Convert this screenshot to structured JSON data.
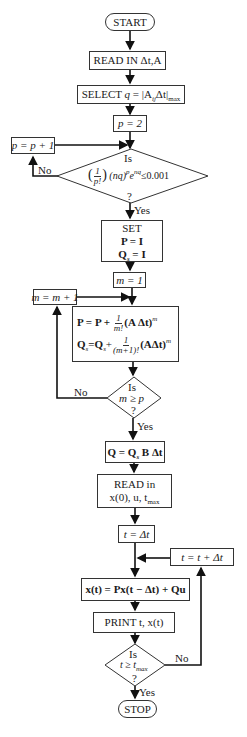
{
  "flowchart": {
    "start": "START",
    "read_in_1": "READ IN Δt,A",
    "select": {
      "prefix": "SELECT ",
      "q": "q",
      "eq": " = |A",
      "sub_ij": "ij",
      "dt": "Δt|",
      "sub_max": "max"
    },
    "p_init": "p = 2",
    "p_incr": "p = p + 1",
    "decision_1": {
      "is": "Is",
      "condition": "(1/p!) (nq)^p e^nq ≤ 0.001",
      "num": "1",
      "den": "p!",
      "expr": "(nq)",
      "sup_p": "p",
      "e": "e",
      "sup_nq": "nq",
      "tail": "≤0.001",
      "q": "?"
    },
    "decision_1_no": "No",
    "decision_1_yes": "Yes",
    "set_box": {
      "title": "SET",
      "line1": "P = I",
      "line2_q": "Q",
      "line2_sub": "s",
      "line2_rest": " = I"
    },
    "m_init": "m = 1",
    "m_incr": "m = m + 1",
    "update_box": {
      "line1_a": "P = P + ",
      "line1_num": "1",
      "line1_den": "m!",
      "line1_b": "(A Δt)",
      "line1_sup": "m",
      "line2_q": "Q",
      "line2_sub": "s",
      "line2_eq": "=Q",
      "line2_sub2": "s",
      "line2_plus": "+",
      "line2_num": "1",
      "line2_den": "(m+1)!",
      "line2_b": "(AΔt)",
      "line2_sup": "m"
    },
    "decision_2": {
      "is": "Is",
      "condition": "m ≥ p",
      "q": "?"
    },
    "decision_2_no": "No",
    "decision_2_yes": "Yes",
    "q_box": {
      "a": "Q = Q",
      "sub": "s",
      "b": " B Δt"
    },
    "read_in_2": {
      "line1": "READ in",
      "line2": "x(0), u, t",
      "sub": "max"
    },
    "t_init": "t = Δt",
    "t_incr": "t = t + Δt",
    "x_update": "x(t) = Px(t − Δt) + Qu",
    "print": "PRINT  t, x(t)",
    "decision_3": {
      "is": "Is",
      "condition": "t ≥ t",
      "sub": "max",
      "q": "?"
    },
    "decision_3_no": "No",
    "decision_3_yes": "Yes",
    "stop": "STOP"
  }
}
